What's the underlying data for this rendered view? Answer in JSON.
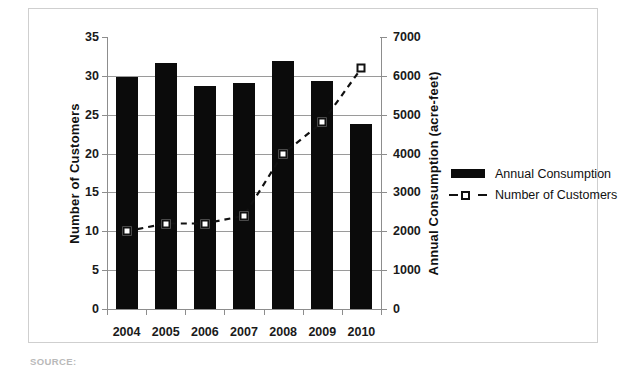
{
  "chart_data": {
    "type": "bar",
    "categories": [
      "2004",
      "2005",
      "2006",
      "2007",
      "2008",
      "2009",
      "2010"
    ],
    "series": [
      {
        "name": "Annual Consumption",
        "type": "bar",
        "axis": "right",
        "unit": "acre-feet",
        "values": [
          5980,
          6320,
          5740,
          5820,
          6380,
          5880,
          4760
        ]
      },
      {
        "name": "Number of Customers",
        "type": "line",
        "style": "dashed-with-open-square-markers",
        "axis": "left",
        "values": [
          10,
          11,
          11,
          12,
          20,
          24,
          31
        ]
      }
    ],
    "title": "",
    "xlabel": "",
    "ylabel": "Number of Customers",
    "y2label": "Annual Consumption (acre-feet)",
    "ylim": [
      0,
      35
    ],
    "y2lim": [
      0,
      7000
    ],
    "yticks": [
      "0",
      "5",
      "10",
      "15",
      "20",
      "25",
      "30",
      "35"
    ],
    "y2ticks": [
      "0",
      "1000",
      "2000",
      "3000",
      "4000",
      "5000",
      "6000",
      "7000"
    ],
    "grid": "horizontal",
    "legend_position": "right",
    "legend": [
      "Annual Consumption",
      "Number of Customers"
    ],
    "colors": {
      "bar": "#0b0b0b",
      "line": "#111111",
      "marker_fill": "#ffffff",
      "gridline": "#9a9a9a",
      "axis": "#8d8d8d",
      "frame": "#cfcfcf",
      "text": "#1a1a1a"
    }
  },
  "axis_left": {
    "title": "Number of Customers",
    "ticks": [
      "35",
      "30",
      "25",
      "20",
      "15",
      "10",
      "5",
      "0"
    ]
  },
  "axis_right": {
    "title": "Annual Consumption (acre-feet)",
    "ticks": [
      "7000",
      "6000",
      "5000",
      "4000",
      "3000",
      "2000",
      "1000",
      "0"
    ]
  },
  "axis_x": {
    "ticks": [
      "2004",
      "2005",
      "2006",
      "2007",
      "2008",
      "2009",
      "2010"
    ]
  },
  "legend": {
    "items": [
      {
        "label": "Annual Consumption",
        "key": "filled-bar-swatch"
      },
      {
        "label": "Number of Customers",
        "key": "dashed-line-open-square-marker"
      }
    ]
  },
  "caption": {
    "source": "SOURCE:"
  }
}
